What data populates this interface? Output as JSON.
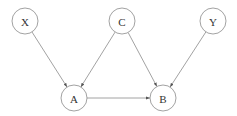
{
  "diagram": {
    "type": "directed-graph",
    "nodes": [
      {
        "id": "X",
        "label": "X",
        "cx": 25,
        "cy": 21,
        "r": 13
      },
      {
        "id": "C",
        "label": "C",
        "cx": 122,
        "cy": 21,
        "r": 13
      },
      {
        "id": "Y",
        "label": "Y",
        "cx": 213,
        "cy": 21,
        "r": 13
      },
      {
        "id": "A",
        "label": "A",
        "cx": 74,
        "cy": 98,
        "r": 13
      },
      {
        "id": "B",
        "label": "B",
        "cx": 163,
        "cy": 98,
        "r": 13
      }
    ],
    "edges": [
      {
        "from": "X",
        "to": "A"
      },
      {
        "from": "C",
        "to": "A"
      },
      {
        "from": "C",
        "to": "B"
      },
      {
        "from": "Y",
        "to": "B"
      },
      {
        "from": "A",
        "to": "B"
      }
    ],
    "colors": {
      "stroke": "#8a8a8a",
      "text": "#333333",
      "background": "#ffffff"
    }
  }
}
